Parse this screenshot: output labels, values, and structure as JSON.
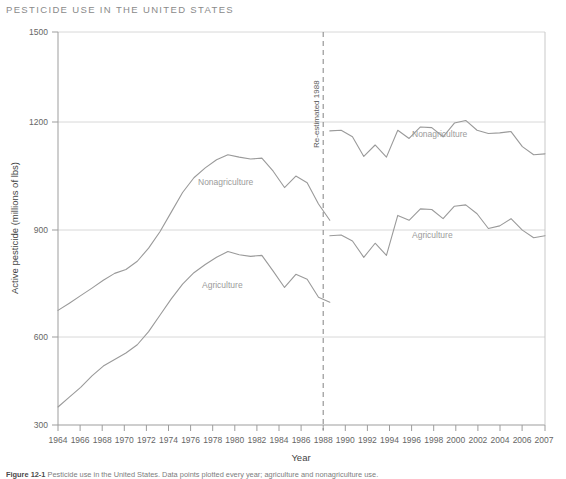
{
  "title": "PESTICIDE USE IN THE UNITED STATES",
  "caption_prefix": "Figure 12-1",
  "caption_text": "Pesticide use in the United States. Data points plotted every year; agriculture and nonagriculture use.",
  "axes": {
    "xlabel": "Year",
    "ylabel": "Active pesticide (millions of lbs)",
    "ytick_labels": [
      "1500",
      "1200",
      "900",
      "600",
      "300"
    ],
    "xtick_labels": [
      "1964",
      "1966",
      "1968",
      "1970",
      "1972",
      "1974",
      "1976",
      "1978",
      "1980",
      "1982",
      "1984",
      "1986",
      "1988",
      "1990",
      "1992",
      "1994",
      "1996",
      "1998",
      "2000",
      "2002",
      "2004",
      "2006",
      "2007"
    ]
  },
  "annotation": {
    "label": "Re-estimated 1988",
    "year": 1988
  },
  "series_labels": {
    "nonagriculture_left": "Nonagriculture",
    "agriculture_left": "Agriculture",
    "nonagriculture_right": "Nonagriculture",
    "agriculture_right": "Agriculture"
  },
  "colors": {
    "line": "#9a9a9a",
    "grid": "#d8d8d8",
    "axis": "#aaaaaa",
    "title": "#8a8a8a",
    "series_label": "#9b9b9b"
  },
  "chart_data": {
    "type": "line",
    "title": "PESTICIDE USE IN THE UNITED STATES",
    "xlabel": "Year",
    "ylabel": "Active pesticide (millions of lbs)",
    "xlim": [
      1964,
      2007
    ],
    "ylim": [
      300,
      1500
    ],
    "yticks": [
      300,
      600,
      900,
      1200,
      1500
    ],
    "xticks": [
      1964,
      1966,
      1968,
      1970,
      1972,
      1974,
      1976,
      1978,
      1980,
      1982,
      1984,
      1986,
      1988,
      1990,
      1992,
      1994,
      1996,
      1998,
      2000,
      2002,
      2004,
      2006,
      2007
    ],
    "grid": "horizontal",
    "legend": "inline-labels",
    "annotations": [
      {
        "type": "vline",
        "x": 1988,
        "style": "dashed",
        "label": "Re-estimated 1988",
        "orientation": "vertical"
      }
    ],
    "series": [
      {
        "name": "Nonagriculture",
        "segment": "pre-1988",
        "x": [
          1964,
          1965,
          1966,
          1967,
          1968,
          1969,
          1970,
          1971,
          1972,
          1973,
          1974,
          1975,
          1976,
          1977,
          1978,
          1979,
          1980,
          1981,
          1982,
          1983,
          1984,
          1985,
          1986,
          1987,
          1988
        ],
        "values": [
          650,
          672,
          695,
          718,
          742,
          763,
          775,
          800,
          840,
          890,
          950,
          1010,
          1055,
          1085,
          1110,
          1125,
          1118,
          1112,
          1115,
          1075,
          1025,
          1060,
          1040,
          975,
          925
        ]
      },
      {
        "name": "Nonagriculture",
        "segment": "post-1988",
        "x": [
          1988,
          1989,
          1990,
          1991,
          1992,
          1993,
          1994,
          1995,
          1996,
          1997,
          1998,
          1999,
          2000,
          2001,
          2002,
          2003,
          2004,
          2005,
          2006,
          2007
        ],
        "values": [
          1198,
          1200,
          1180,
          1120,
          1155,
          1118,
          1200,
          1175,
          1210,
          1208,
          1180,
          1222,
          1230,
          1200,
          1190,
          1192,
          1196,
          1150,
          1125,
          1128
        ]
      },
      {
        "name": "Agriculture",
        "segment": "pre-1988",
        "x": [
          1964,
          1965,
          1966,
          1967,
          1968,
          1969,
          1970,
          1971,
          1972,
          1973,
          1974,
          1975,
          1976,
          1977,
          1978,
          1979,
          1980,
          1981,
          1982,
          1983,
          1984,
          1985,
          1986,
          1987,
          1988
        ],
        "values": [
          355,
          385,
          415,
          450,
          480,
          500,
          520,
          545,
          585,
          635,
          685,
          730,
          765,
          790,
          812,
          830,
          820,
          815,
          818,
          770,
          720,
          760,
          745,
          690,
          675
        ]
      },
      {
        "name": "Agriculture",
        "segment": "post-1988",
        "x": [
          1988,
          1989,
          1990,
          1991,
          1992,
          1993,
          1994,
          1995,
          1996,
          1997,
          1998,
          1999,
          2000,
          2001,
          2002,
          2003,
          2004,
          2005,
          2006,
          2007
        ],
        "values": [
          878,
          880,
          862,
          812,
          855,
          818,
          940,
          925,
          960,
          958,
          930,
          968,
          972,
          945,
          900,
          908,
          930,
          895,
          872,
          878
        ]
      }
    ]
  }
}
